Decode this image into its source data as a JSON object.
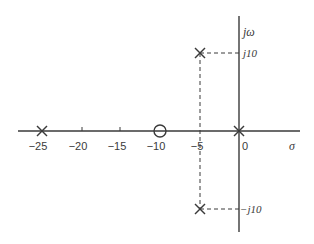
{
  "diagram": {
    "type": "s-plane pole-zero plot",
    "axes": {
      "real_axis_label": "σ",
      "imag_axis_label": "jω",
      "real_ticks": [
        {
          "value": -25,
          "label": "−25"
        },
        {
          "value": -20,
          "label": "−20"
        },
        {
          "value": -15,
          "label": "−15"
        },
        {
          "value": -10,
          "label": "−10"
        },
        {
          "value": -5,
          "label": "−5"
        },
        {
          "value": 0,
          "label": "0"
        }
      ],
      "imag_ticks": [
        {
          "value": 10,
          "label": "j10"
        },
        {
          "value": -10,
          "label": "−j10"
        }
      ]
    },
    "poles": [
      {
        "re": -25,
        "im": 0
      },
      {
        "re": 0,
        "im": 0
      },
      {
        "re": -5,
        "im": 10
      },
      {
        "re": -5,
        "im": -10
      }
    ],
    "zeros": [
      {
        "re": -10,
        "im": 0
      }
    ],
    "colors": {
      "line": "#3a3a3a",
      "background": "#ffffff"
    }
  }
}
